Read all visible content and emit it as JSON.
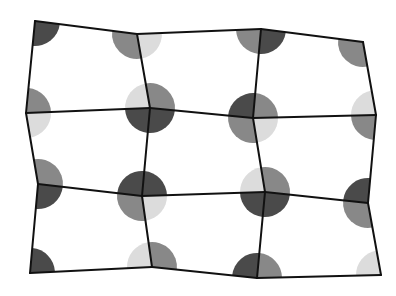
{
  "diagram": {
    "type": "distorted-grid-with-vertex-quadrant-circles",
    "width": 396,
    "height": 296,
    "circle_radius": 25,
    "line_color": "#111111",
    "line_width": 2,
    "shades": {
      "dark": "#4a4a4a",
      "mid": "#888888",
      "light": "#dcdcdc"
    },
    "vertices": [
      [
        [
          35,
          21
        ],
        [
          137,
          34
        ],
        [
          261,
          29
        ],
        [
          363,
          42
        ]
      ],
      [
        [
          26,
          113
        ],
        [
          150,
          108
        ],
        [
          253,
          118
        ],
        [
          376,
          115
        ]
      ],
      [
        [
          38,
          184
        ],
        [
          142,
          196
        ],
        [
          265,
          192
        ],
        [
          368,
          203
        ]
      ],
      [
        [
          30,
          273
        ],
        [
          152,
          267
        ],
        [
          257,
          278
        ],
        [
          381,
          275
        ]
      ]
    ],
    "quadrants": [
      [
        {
          "tl": "none",
          "tr": "none",
          "bl": "none",
          "br": "dark"
        },
        {
          "tl": "none",
          "tr": "none",
          "bl": "mid",
          "br": "light"
        },
        {
          "tl": "none",
          "tr": "none",
          "bl": "mid",
          "br": "dark"
        },
        {
          "tl": "none",
          "tr": "none",
          "bl": "mid",
          "br": "none"
        }
      ],
      [
        {
          "tl": "none",
          "tr": "mid",
          "bl": "none",
          "br": "light"
        },
        {
          "tl": "light",
          "tr": "mid",
          "bl": "dark",
          "br": "dark"
        },
        {
          "tl": "dark",
          "tr": "mid",
          "bl": "mid",
          "br": "light"
        },
        {
          "tl": "light",
          "tr": "none",
          "bl": "mid",
          "br": "none"
        }
      ],
      [
        {
          "tl": "none",
          "tr": "mid",
          "bl": "none",
          "br": "dark"
        },
        {
          "tl": "dark",
          "tr": "dark",
          "bl": "mid",
          "br": "light"
        },
        {
          "tl": "light",
          "tr": "mid",
          "bl": "dark",
          "br": "dark"
        },
        {
          "tl": "dark",
          "tr": "none",
          "bl": "mid",
          "br": "none"
        }
      ],
      [
        {
          "tl": "none",
          "tr": "dark",
          "bl": "none",
          "br": "none"
        },
        {
          "tl": "light",
          "tr": "mid",
          "bl": "none",
          "br": "none"
        },
        {
          "tl": "dark",
          "tr": "mid",
          "bl": "none",
          "br": "none"
        },
        {
          "tl": "light",
          "tr": "none",
          "bl": "none",
          "br": "none"
        }
      ]
    ]
  }
}
